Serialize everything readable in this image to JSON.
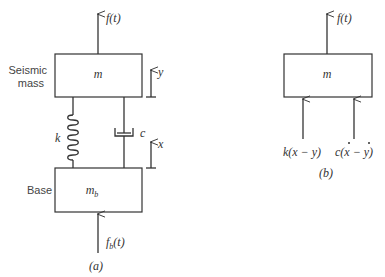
{
  "figure_a": {
    "caption": "(a)",
    "seismic_mass": {
      "label_line1": "Seismic",
      "label_line2": "mass",
      "symbol": "m"
    },
    "base": {
      "label": "Base",
      "symbol": "m",
      "symbol_sub": "b"
    },
    "force_top": "f(t)",
    "force_bottom": "f",
    "force_bottom_sub": "b",
    "force_bottom_arg": "(t)",
    "spring_label": "k",
    "damper_label": "c",
    "disp_mass": "y",
    "disp_base": "x"
  },
  "figure_b": {
    "caption": "(b)",
    "mass_symbol": "m",
    "force_top": "f(t)",
    "spring_force": "k(x − y)",
    "damper_force_prefix": "c(",
    "damper_force_x": "x",
    "damper_force_mid": " − ",
    "damper_force_y": "y",
    "damper_force_suffix": ")"
  }
}
